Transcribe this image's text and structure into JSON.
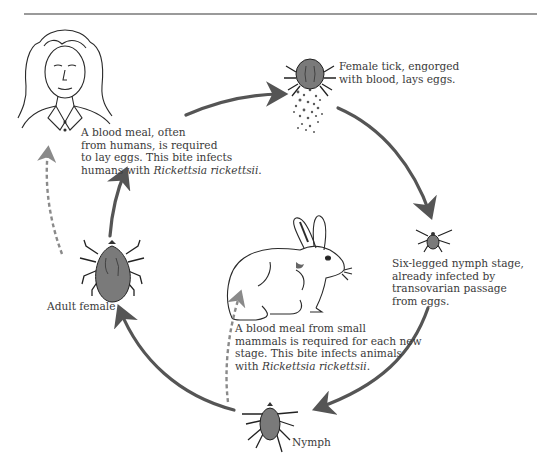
{
  "diagram": {
    "colors": {
      "arrow": "#555555",
      "dashed_arrow": "#8a8a8a",
      "tick_body": "#7a7a7a",
      "text": "#3a3a3a",
      "rule": "#9a9a9a"
    },
    "nodes": {
      "human": {
        "caption": ""
      },
      "engorged_female": {
        "lines": [
          "Female tick, engorged",
          "with blood, lays eggs."
        ]
      },
      "six_legged_nymph": {
        "lines": [
          "Six-legged nymph stage,",
          "already infected by",
          "transovarian passage",
          "from eggs."
        ]
      },
      "nymph": {
        "label": "Nymph"
      },
      "adult_female": {
        "label": "Adult female"
      },
      "rabbit": {
        "caption": ""
      }
    },
    "annotations": {
      "human_meal": {
        "line1": "A blood meal, often",
        "line2": "from humans, is required",
        "line3": "to lay eggs. This bite infects",
        "line4_prefix": "humans with ",
        "line4_italic": "Rickettsia rickettsii",
        "line4_suffix": "."
      },
      "mammal_meal": {
        "line1": "A blood meal from small",
        "line2": "mammals is required for each new",
        "line3": "stage. This bite infects animals",
        "line4_prefix": "with ",
        "line4_italic": "Rickettsia rickettsii",
        "line4_suffix": "."
      }
    },
    "arrows": [
      {
        "from": "adult_female",
        "to": "human_meal_text",
        "style": "solid"
      },
      {
        "from": "human_meal_text",
        "to": "engorged_female",
        "style": "solid"
      },
      {
        "from": "engorged_female",
        "to": "six_legged_nymph",
        "style": "solid"
      },
      {
        "from": "six_legged_nymph",
        "to": "nymph",
        "style": "solid"
      },
      {
        "from": "nymph",
        "to": "adult_female",
        "style": "solid"
      },
      {
        "from": "adult_female",
        "to": "human",
        "style": "dashed"
      },
      {
        "from": "nymph",
        "to": "rabbit",
        "style": "dashed"
      }
    ]
  }
}
